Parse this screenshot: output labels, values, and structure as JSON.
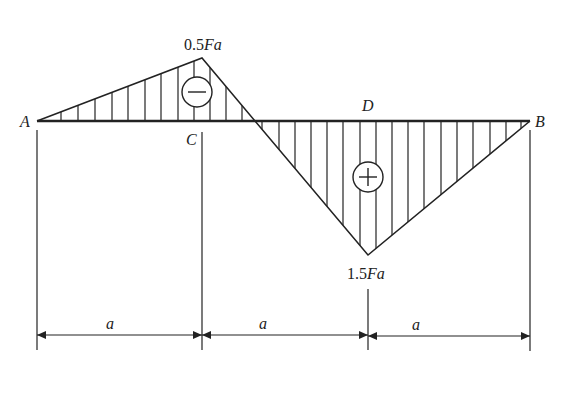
{
  "diagram": {
    "type": "bending-moment-diagram",
    "points": {
      "A": {
        "label": "A",
        "x": 37
      },
      "C": {
        "label": "C",
        "x": 202
      },
      "D": {
        "label": "D",
        "x": 368
      },
      "B": {
        "label": "B",
        "x": 530
      }
    },
    "values": {
      "peak_negative": {
        "num": "0.5",
        "sym": "Fa",
        "at": "C"
      },
      "peak_positive": {
        "num": "1.5",
        "sym": "Fa",
        "at": "D"
      }
    },
    "signs": {
      "negative": "−",
      "positive": "+"
    },
    "dimensions": [
      {
        "label": "a"
      },
      {
        "label": "a"
      },
      {
        "label": "a"
      }
    ],
    "colors": {
      "stroke": "#222222",
      "background": "#ffffff"
    }
  }
}
